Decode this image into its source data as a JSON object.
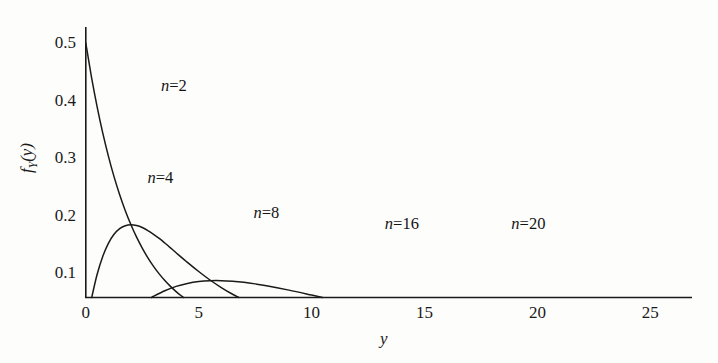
{
  "chart_data": {
    "type": "line",
    "title": "",
    "subtitle": "",
    "xlabel": "y",
    "ylabel": "f_Y(y)",
    "xlabel_display": "y",
    "ylabel_main": "f",
    "ylabel_sub": "Y",
    "ylabel_arg": "(y)",
    "xlim": [
      0,
      27.5
    ],
    "ylim": [
      0.058,
      0.54
    ],
    "grid": false,
    "legend": "inline-annotations",
    "xticks": [
      0,
      5,
      10,
      15,
      20,
      25
    ],
    "xtick_labels": [
      "0",
      "5",
      "10",
      "15",
      "20",
      "25"
    ],
    "yticks": [
      0.1,
      0.2,
      0.3,
      0.4,
      0.5
    ],
    "ytick_labels": [
      "0.1",
      "0.2",
      "0.3",
      "0.4",
      "0.5"
    ],
    "curve_color": "#1a1a1a",
    "axis_color": "#1a1a1a",
    "background_color": "#fdfdfc",
    "note": "Chi-square probability density functions f_Y(y) for degrees of freedom n = 2, 4, 8, 16, 20; curves clipped at the axis baseline y-value of about 0.058",
    "annotations": [
      {
        "text": "n=2",
        "n": 2,
        "x_data": 3.9,
        "y_data": 0.425
      },
      {
        "text": "n=4",
        "n": 4,
        "x_data": 3.3,
        "y_data": 0.265
      },
      {
        "text": "n=8",
        "n": 8,
        "x_data": 8.0,
        "y_data": 0.205
      },
      {
        "text": "n=16",
        "n": 16,
        "x_data": 14.0,
        "y_data": 0.185
      },
      {
        "text": "n=20",
        "n": 20,
        "x_data": 19.6,
        "y_data": 0.185
      }
    ],
    "series": [
      {
        "name": "n=2",
        "n": 2,
        "peak_x": 0,
        "peak_y": 0.5,
        "points": [
          [
            0.0,
            0.5
          ],
          [
            0.25,
            0.4412
          ],
          [
            0.5,
            0.3894
          ],
          [
            0.75,
            0.3436
          ],
          [
            1.0,
            0.3033
          ],
          [
            1.25,
            0.2676
          ],
          [
            1.5,
            0.2362
          ],
          [
            1.75,
            0.2084
          ],
          [
            2.0,
            0.1839
          ],
          [
            2.25,
            0.1623
          ],
          [
            2.5,
            0.1433
          ],
          [
            2.75,
            0.1264
          ],
          [
            3.0,
            0.1116
          ],
          [
            3.25,
            0.0985
          ],
          [
            3.5,
            0.0869
          ],
          [
            3.75,
            0.0767
          ],
          [
            4.0,
            0.0677
          ],
          [
            4.25,
            0.0597
          ],
          [
            4.5,
            0.0527
          ],
          [
            4.75,
            0.0465
          ],
          [
            5.0,
            0.041
          ],
          [
            5.5,
            0.0319
          ],
          [
            6.0,
            0.0249
          ],
          [
            7.0,
            0.0151
          ],
          [
            8.0,
            0.0092
          ],
          [
            9.0,
            0.0056
          ],
          [
            10.0,
            0.0034
          ]
        ]
      },
      {
        "name": "n=4",
        "n": 4,
        "peak_x": 2,
        "peak_y": 0.1839,
        "points": [
          [
            0.0,
            0.0
          ],
          [
            0.25,
            0.0554
          ],
          [
            0.5,
            0.0974
          ],
          [
            0.75,
            0.1288
          ],
          [
            1.0,
            0.1516
          ],
          [
            1.25,
            0.1673
          ],
          [
            1.5,
            0.1772
          ],
          [
            1.75,
            0.1823
          ],
          [
            2.0,
            0.1839
          ],
          [
            2.25,
            0.1825
          ],
          [
            2.5,
            0.1791
          ],
          [
            2.75,
            0.1738
          ],
          [
            3.0,
            0.1673
          ],
          [
            3.25,
            0.1601
          ],
          [
            3.5,
            0.1521
          ],
          [
            3.75,
            0.1438
          ],
          [
            4.0,
            0.1353
          ],
          [
            4.5,
            0.1185
          ],
          [
            5.0,
            0.1026
          ],
          [
            5.5,
            0.0878
          ],
          [
            6.0,
            0.0747
          ],
          [
            6.5,
            0.063
          ],
          [
            7.0,
            0.0528
          ],
          [
            7.5,
            0.0441
          ],
          [
            8.0,
            0.0366
          ],
          [
            9.0,
            0.025
          ],
          [
            10.0,
            0.0168
          ],
          [
            11.0,
            0.0112
          ],
          [
            12.0,
            0.0074
          ],
          [
            13.0,
            0.0048
          ],
          [
            14.0,
            0.0032
          ],
          [
            15.0,
            0.0021
          ]
        ]
      },
      {
        "name": "n=8",
        "n": 8,
        "peak_x": 6,
        "peak_y": 0.1255,
        "points": [
          [
            0.0,
            0.0
          ],
          [
            0.5,
            0.0012
          ],
          [
            1.0,
            0.008
          ],
          [
            1.5,
            0.0199
          ],
          [
            2.0,
            0.0338
          ],
          [
            2.5,
            0.0475
          ],
          [
            3.0,
            0.0595
          ],
          [
            3.5,
            0.0692
          ],
          [
            4.0,
            0.0767
          ],
          [
            4.5,
            0.0818
          ],
          [
            5.0,
            0.0851
          ],
          [
            5.5,
            0.0866
          ],
          [
            6.0,
            0.0867
          ],
          [
            6.5,
            0.0857
          ],
          [
            7.0,
            0.0838
          ],
          [
            7.5,
            0.0811
          ],
          [
            8.0,
            0.0779
          ],
          [
            9.0,
            0.0702
          ],
          [
            10.0,
            0.0616
          ],
          [
            11.0,
            0.0529
          ],
          [
            12.0,
            0.0446
          ],
          [
            13.0,
            0.037
          ],
          [
            14.0,
            0.0303
          ],
          [
            15.0,
            0.0246
          ],
          [
            16.0,
            0.0197
          ],
          [
            17.0,
            0.0157
          ],
          [
            18.0,
            0.0124
          ],
          [
            19.0,
            0.0097
          ],
          [
            20.0,
            0.0076
          ],
          [
            22.0,
            0.0045
          ],
          [
            24.0,
            0.0026
          ],
          [
            26.0,
            0.0015
          ]
        ]
      },
      {
        "name": "n=16",
        "n": 16,
        "peak_x": 14,
        "peak_y": 0.0644,
        "points": [
          [
            0.0,
            0.0
          ],
          [
            2.0,
            0.0003
          ],
          [
            3.0,
            0.0016
          ],
          [
            4.0,
            0.0045
          ],
          [
            5.0,
            0.0092
          ],
          [
            6.0,
            0.0152
          ],
          [
            7.0,
            0.0219
          ],
          [
            8.0,
            0.0286
          ],
          [
            9.0,
            0.0347
          ],
          [
            10.0,
            0.0397
          ],
          [
            11.0,
            0.0436
          ],
          [
            12.0,
            0.0462
          ],
          [
            13.0,
            0.0476
          ],
          [
            14.0,
            0.0479
          ],
          [
            15.0,
            0.0473
          ],
          [
            16.0,
            0.0459
          ],
          [
            17.0,
            0.0438
          ],
          [
            18.0,
            0.0412
          ],
          [
            19.0,
            0.0383
          ],
          [
            20.0,
            0.0352
          ],
          [
            21.0,
            0.0319
          ],
          [
            22.0,
            0.0286
          ],
          [
            23.0,
            0.0254
          ],
          [
            24.0,
            0.0223
          ],
          [
            25.0,
            0.0194
          ],
          [
            26.0,
            0.0168
          ],
          [
            27.0,
            0.0144
          ]
        ]
      },
      {
        "name": "n=20",
        "n": 20,
        "peak_x": 18,
        "peak_y": 0.055,
        "points": [
          [
            0.0,
            0.0
          ],
          [
            4.0,
            0.0007
          ],
          [
            5.0,
            0.0018
          ],
          [
            6.0,
            0.0038
          ],
          [
            7.0,
            0.0069
          ],
          [
            8.0,
            0.0108
          ],
          [
            9.0,
            0.0154
          ],
          [
            10.0,
            0.0203
          ],
          [
            11.0,
            0.0251
          ],
          [
            12.0,
            0.0297
          ],
          [
            13.0,
            0.0336
          ],
          [
            14.0,
            0.0367
          ],
          [
            15.0,
            0.039
          ],
          [
            16.0,
            0.0405
          ],
          [
            17.0,
            0.0412
          ],
          [
            18.0,
            0.0412
          ],
          [
            19.0,
            0.0407
          ],
          [
            20.0,
            0.0396
          ],
          [
            21.0,
            0.0382
          ],
          [
            22.0,
            0.0364
          ],
          [
            23.0,
            0.0343
          ],
          [
            24.0,
            0.0321
          ],
          [
            25.0,
            0.0297
          ],
          [
            26.0,
            0.0273
          ],
          [
            27.0,
            0.0249
          ]
        ]
      }
    ]
  }
}
